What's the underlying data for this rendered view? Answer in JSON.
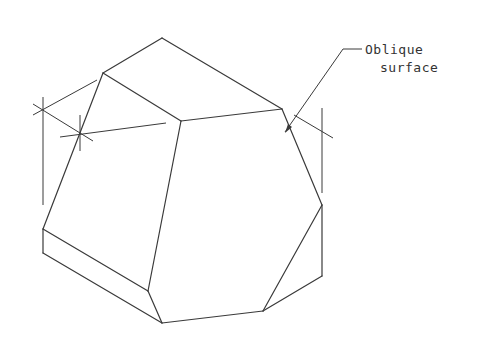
{
  "diagram": {
    "type": "isometric-technical-drawing",
    "stroke_color": "#3a3a3a",
    "background": "#ffffff",
    "annotation": {
      "line1": "Oblique",
      "line2": "surface"
    },
    "edges": [
      [
        162,
        38,
        103,
        73
      ],
      [
        162,
        38,
        282,
        109
      ],
      [
        103,
        73,
        181,
        121
      ],
      [
        181,
        121,
        282,
        109
      ],
      [
        103,
        73,
        43,
        229
      ],
      [
        43,
        229,
        43,
        253
      ],
      [
        43,
        229,
        148,
        291
      ],
      [
        43,
        253,
        162,
        323
      ],
      [
        148,
        291,
        162,
        323
      ],
      [
        181,
        121,
        148,
        291
      ],
      [
        282,
        109,
        322,
        205
      ],
      [
        322,
        205,
        322,
        276
      ],
      [
        322,
        205,
        263,
        311
      ],
      [
        322,
        276,
        263,
        311
      ],
      [
        263,
        311,
        162,
        323
      ]
    ],
    "construction_lines": [
      [
        43,
        97,
        43,
        205
      ],
      [
        33,
        115,
        97,
        80
      ],
      [
        33,
        104,
        93,
        141
      ],
      [
        80,
        115,
        80,
        151
      ],
      [
        60,
        137,
        166,
        123
      ],
      [
        322,
        108,
        322,
        193
      ],
      [
        294,
        115,
        333,
        138
      ]
    ],
    "leader": {
      "points": [
        [
          362,
          49
        ],
        [
          343,
          49
        ],
        [
          285,
          132
        ]
      ]
    }
  }
}
